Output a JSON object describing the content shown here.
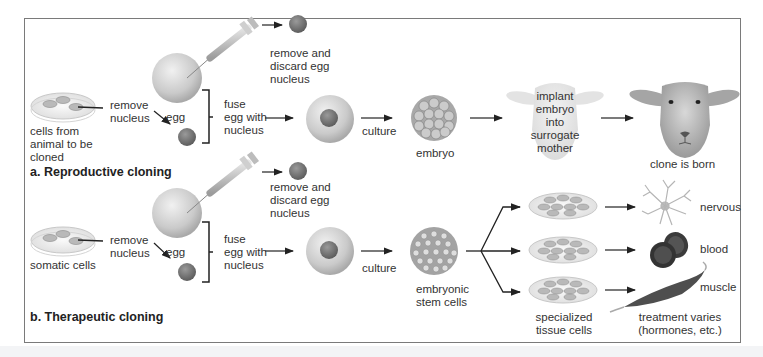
{
  "diagram": {
    "panels": [
      {
        "id": "a",
        "title": "a. Reproductive cloning",
        "steps": {
          "source_cells": "cells from\nanimal to be\ncloned",
          "remove_nucleus": "remove\nnucleus",
          "egg": "egg",
          "discard_egg_nucleus": "remove and\ndiscard egg\nnucleus",
          "fuse": "fuse\negg with\nnucleus",
          "culture": "culture",
          "embryo": "embryo",
          "implant": "implant\nembryo\ninto\nsurrogate\nmother",
          "result": "clone is born"
        }
      },
      {
        "id": "b",
        "title": "b. Therapeutic cloning",
        "steps": {
          "source_cells": "somatic cells",
          "remove_nucleus": "remove\nnucleus",
          "egg": "egg",
          "discard_egg_nucleus": "remove and\ndiscard egg\nnucleus",
          "fuse": "fuse\negg with\nnucleus",
          "culture": "culture",
          "stem_cells": "embryonic\nstem cells",
          "specialized": "specialized\ntissue cells",
          "treatment": "treatment varies\n(hormones, etc.)",
          "tissues": [
            "nervous",
            "blood",
            "muscle"
          ]
        }
      }
    ],
    "colors": {
      "frame": "#7a7a7a",
      "egg": "#cfcfcf",
      "nucleus": "#7d7d7d",
      "blood": "#3a3a3a",
      "muscle": "#5a5a5a",
      "arrow": "#222222"
    }
  }
}
